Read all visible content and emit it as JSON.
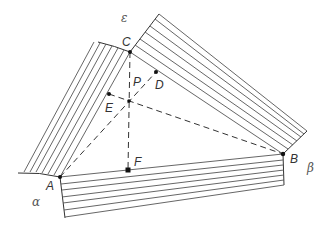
{
  "figure": {
    "type": "geometric-diagram",
    "points": {
      "A": {
        "label": "A",
        "x": 60,
        "y": 177
      },
      "B": {
        "label": "B",
        "x": 283,
        "y": 154
      },
      "C": {
        "label": "C",
        "x": 130,
        "y": 52
      },
      "P": {
        "label": "P",
        "x": 129,
        "y": 101
      },
      "D": {
        "label": "D",
        "x": 156,
        "y": 72
      },
      "E": {
        "label": "E",
        "x": 109,
        "y": 94
      },
      "F": {
        "label": "F",
        "x": 128,
        "y": 170
      }
    },
    "region_labels": {
      "epsilon": "ε",
      "alpha": "α",
      "beta": "β"
    },
    "colors": {
      "line": "#333333",
      "hatch": "#555555",
      "background": "#ffffff"
    }
  }
}
